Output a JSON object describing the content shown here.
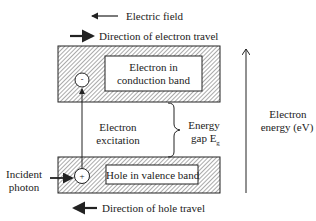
{
  "diagram": {
    "legend": {
      "electric_field": "Electric field",
      "electron_travel": "Direction of electron travel",
      "hole_travel": "Direction of hole travel"
    },
    "conduction_band": {
      "label_line1": "Electron in",
      "label_line2": "conduction band",
      "particle_symbol": "-"
    },
    "valence_band": {
      "label": "Hole in valence band",
      "particle_symbol": "+"
    },
    "excitation": {
      "line1": "Electron",
      "line2": "excitation"
    },
    "energy_gap": {
      "line1": "Energy",
      "line2": "gap E",
      "subscript": "g"
    },
    "incident_photon": {
      "line1": "Incident",
      "line2": "photon"
    },
    "energy_axis": {
      "line1": "Electron",
      "line2": "energy (eV)"
    },
    "colors": {
      "line": "#222222",
      "hatch": "#555555",
      "background": "#ffffff"
    }
  }
}
